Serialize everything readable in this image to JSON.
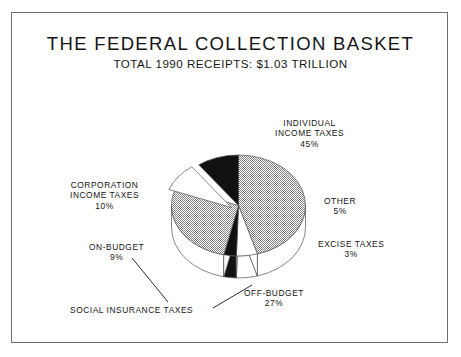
{
  "chart_data": {
    "type": "pie",
    "title": "THE FEDERAL COLLECTION BASKET",
    "subtitle": "TOTAL 1990 RECEIPTS:  $1.03 TRILLION",
    "total_label": "$1.03 TRILLION",
    "year": "1990",
    "units": "percent of total receipts",
    "xlabel": "",
    "ylabel": "",
    "grid": false,
    "legend": "none (direct slice labels with leader lines)",
    "style": "3D exploded pie, black-and-white print, hatched / solid-black / white fills",
    "categories": [
      "INDIVIDUAL INCOME TAXES",
      "OTHER",
      "EXCISE TAXES",
      "OFF-BUDGET",
      "ON-BUDGET",
      "CORPORATION INCOME TAXES"
    ],
    "values": [
      45,
      5,
      3,
      27,
      9,
      10
    ],
    "slices": [
      {
        "label": "INDIVIDUAL INCOME TAXES",
        "value": 45,
        "pct_text": "45%",
        "fill": "hatch-gray"
      },
      {
        "label": "OTHER",
        "value": 5,
        "pct_text": "5%",
        "fill": "white"
      },
      {
        "label": "EXCISE TAXES",
        "value": 3,
        "pct_text": "3%",
        "fill": "black"
      },
      {
        "label": "OFF-BUDGET",
        "value": 27,
        "pct_text": "27%",
        "fill": "hatch-gray"
      },
      {
        "label": "ON-BUDGET",
        "value": 9,
        "pct_text": "9%",
        "fill": "white"
      },
      {
        "label": "CORPORATION INCOME TAXES",
        "value": 10,
        "pct_text": "10%",
        "fill": "black"
      }
    ],
    "group_annotation": {
      "label": "SOCIAL INSURANCE TAXES",
      "members": [
        "ON-BUDGET",
        "OFF-BUDGET"
      ],
      "combined_value": 36
    }
  },
  "labels": {
    "individual": {
      "line1": "INDIVIDUAL",
      "line2": "INCOME TAXES",
      "pct": "45%"
    },
    "corporation": {
      "line1": "CORPORATION",
      "line2": "INCOME TAXES",
      "pct": "10%"
    },
    "other": {
      "line1": "OTHER",
      "pct": "5%"
    },
    "excise": {
      "line1": "EXCISE TAXES",
      "pct": "3%"
    },
    "onbudget": {
      "line1": "ON-BUDGET",
      "pct": "9%"
    },
    "offbudget": {
      "line1": "OFF-BUDGET",
      "pct": "27%"
    },
    "social": {
      "line1": "SOCIAL INSURANCE TAXES"
    }
  },
  "colors": {
    "ink": "#141414",
    "border": "#6f6f6f",
    "black_slice": "#111111",
    "white_slice": "#ffffff",
    "hatch_gray": "#9a9a9a",
    "outline": "#555555",
    "background": "#ffffff"
  }
}
